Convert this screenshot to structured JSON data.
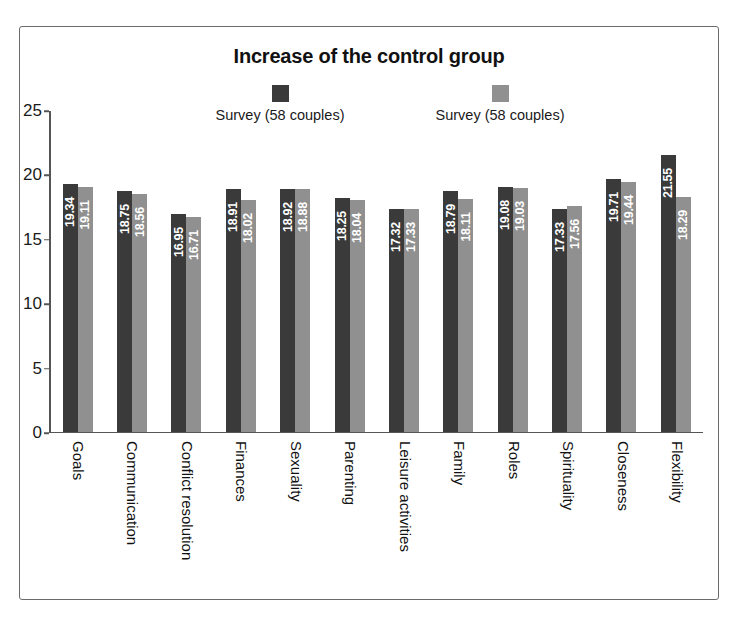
{
  "chart_data": {
    "type": "bar",
    "title": "Increase of the control group",
    "xlabel": "",
    "ylabel": "",
    "ylim": [
      0,
      25
    ],
    "yticks": [
      0,
      5,
      10,
      15,
      20,
      25
    ],
    "grid": false,
    "legend_position": "top-center",
    "categories": [
      "Goals",
      "Communication",
      "Conflict resolution",
      "Finances",
      "Sexuality",
      "Parenting",
      "Leisure activities",
      "Family",
      "Roles",
      "Spirituality",
      "Closeness",
      "Flexibility"
    ],
    "series": [
      {
        "name": "Survey (58 couples)",
        "color": "#3a3a3a",
        "values": [
          19.34,
          18.75,
          16.95,
          18.91,
          18.92,
          18.25,
          17.32,
          18.79,
          19.08,
          17.33,
          19.71,
          21.55
        ],
        "labels": [
          "19.34",
          "18.75",
          "16.95",
          "18.91",
          "18.92",
          "18.25",
          "17.32",
          "18.79",
          "19.08",
          "17.33",
          "19.71",
          "21.55"
        ]
      },
      {
        "name": "Survey (58 couples)",
        "color": "#909090",
        "values": [
          19.11,
          18.56,
          16.71,
          18.02,
          18.88,
          18.04,
          17.33,
          18.11,
          19.03,
          17.56,
          19.44,
          18.29
        ],
        "labels": [
          "19.11",
          "18.56",
          "16.71",
          "18.02",
          "18.88",
          "18.04",
          "17.33",
          "18.11",
          "19.03",
          "17.56",
          "19.44",
          "18.29"
        ]
      }
    ]
  },
  "legend": {
    "items": [
      {
        "label": "Survey (58 couples)",
        "color": "#3a3a3a",
        "swatch": "dark-square-swatch"
      },
      {
        "label": "Survey (58 couples)",
        "color": "#909090",
        "swatch": "light-square-swatch"
      }
    ]
  },
  "axis": {
    "y_tick_labels": [
      "0",
      "5",
      "10",
      "15",
      "20",
      "25"
    ]
  }
}
